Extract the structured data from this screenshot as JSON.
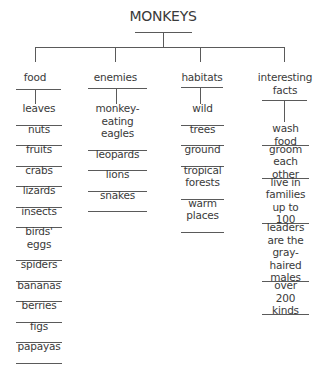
{
  "diagram": {
    "type": "tree-chart",
    "title": "MONKEYS",
    "categories": [
      {
        "label": "food",
        "items": [
          "leaves",
          "nuts",
          "fruits",
          "crabs",
          "lizards",
          "insects",
          "birds' eggs",
          "spiders",
          "bananas",
          "berries",
          "figs",
          "papayas"
        ]
      },
      {
        "label": "enemies",
        "items": [
          "monkey-eating eagles",
          "leopards",
          "lions",
          "snakes"
        ]
      },
      {
        "label": "habitats",
        "items": [
          "wild",
          "trees",
          "ground",
          "tropical forests",
          "warm places"
        ]
      },
      {
        "label": "interesting facts",
        "items": [
          "wash food",
          "groom each other",
          "live in families up to 100",
          "leaders are the gray-haired males",
          "over 200 kinds"
        ]
      }
    ]
  },
  "display": {
    "title": "MONKEYS",
    "food": {
      "label": "food",
      "items": [
        "leaves",
        "nuts",
        "fruits",
        "crabs",
        "lizards",
        "insects",
        "birds'\neggs",
        "spiders",
        "bananas",
        "berries",
        "figs",
        "papayas"
      ]
    },
    "enemies": {
      "label": "enemies",
      "items": [
        "monkey-\neating\neagles",
        "leopards",
        "lions",
        "snakes"
      ]
    },
    "habitats": {
      "label": "habitats",
      "items": [
        "wild",
        "trees",
        "ground",
        "tropical\nforests",
        "warm\nplaces"
      ]
    },
    "facts": {
      "label": "interesting\nfacts",
      "items": [
        "wash food",
        "groom\neach other",
        "live in\nfamilies\nup to 100",
        "leaders\nare the\ngray-haired\nmales",
        "over\n200 kinds"
      ]
    }
  }
}
